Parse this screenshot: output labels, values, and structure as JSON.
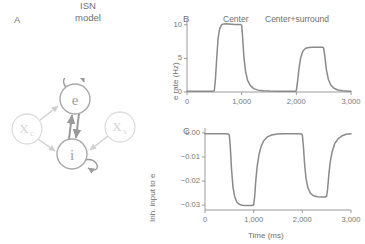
{
  "figure": {
    "panels": [
      {
        "id": "A",
        "letter": "A"
      },
      {
        "id": "B",
        "letter": "B"
      },
      {
        "id": "C",
        "letter": "C"
      }
    ]
  },
  "panel_a": {
    "letter": "A",
    "title_line1": "ISN",
    "title_line2": "model",
    "nodes": [
      {
        "id": "e",
        "label": "e",
        "role": "excitatory-population",
        "cx": 65,
        "cy": 20,
        "r": 15,
        "color": "#8f8f8f"
      },
      {
        "id": "i",
        "label": "i",
        "role": "inhibitory-population",
        "cx": 62,
        "cy": 76,
        "r": 15,
        "color": "#8f8f8f"
      },
      {
        "id": "xc",
        "label": "X",
        "sub": "c",
        "role": "center-input",
        "cx": 17,
        "cy": 51,
        "r": 15,
        "color": "#d2d2d2"
      },
      {
        "id": "xs",
        "label": "X",
        "sub": "s",
        "role": "surround-input",
        "cx": 110,
        "cy": 49,
        "r": 15,
        "color": "#d2d2d2"
      }
    ],
    "connections": [
      {
        "from": "e",
        "to": "e",
        "type": "recurrent-excitation"
      },
      {
        "from": "e",
        "to": "i",
        "type": "excitation"
      },
      {
        "from": "i",
        "to": "e",
        "type": "inhibition"
      },
      {
        "from": "i",
        "to": "i",
        "type": "recurrent-inhibition"
      },
      {
        "from": "xc",
        "to": "e",
        "type": "input"
      },
      {
        "from": "xc",
        "to": "i",
        "type": "input"
      },
      {
        "from": "xs",
        "to": "i",
        "type": "input"
      }
    ]
  },
  "conditions": {
    "center": "Center",
    "center_surround": "Center+surround"
  },
  "chart_data": [
    {
      "type": "line",
      "panel": "B",
      "title": "",
      "xlabel": "",
      "ylabel": "e rate (Hz)",
      "xlim": [
        0,
        3000
      ],
      "ylim": [
        0,
        11
      ],
      "xticks": [
        0,
        1000,
        2000,
        3000
      ],
      "xticklabels": [
        "0",
        "1,000",
        "2,000",
        "3,000"
      ],
      "yticks": [
        0,
        5,
        10
      ],
      "yticklabels": [
        "0",
        "5",
        "10"
      ],
      "grid": false,
      "legend": "none",
      "annotations": [
        {
          "text": "Center",
          "x": 750
        },
        {
          "text": "Center+surround",
          "x": 2250
        }
      ],
      "line_color": "#8a8a8a",
      "series": [
        {
          "name": "e rate",
          "x": [
            0,
            100,
            200,
            300,
            400,
            480,
            500,
            520,
            545,
            570,
            600,
            640,
            700,
            760,
            820,
            880,
            940,
            985,
            1000,
            1015,
            1040,
            1070,
            1110,
            1160,
            1220,
            1300,
            1400,
            1520,
            1650,
            1800,
            1950,
            1985,
            2000,
            2020,
            2050,
            2080,
            2120,
            2170,
            2230,
            2300,
            2380,
            2450,
            2485,
            2500,
            2520,
            2550,
            2585,
            2630,
            2690,
            2760,
            2850,
            2950,
            3000
          ],
          "y": [
            0.12,
            0.12,
            0.12,
            0.12,
            0.12,
            0.13,
            0.2,
            1.9,
            5.2,
            8.1,
            9.5,
            10.05,
            10.15,
            10.12,
            10.08,
            10.05,
            10.03,
            10.02,
            9.9,
            8.4,
            5.3,
            3.1,
            1.7,
            0.95,
            0.5,
            0.28,
            0.18,
            0.14,
            0.12,
            0.12,
            0.12,
            0.13,
            0.2,
            1.4,
            3.6,
            5.1,
            6.1,
            6.5,
            6.62,
            6.65,
            6.66,
            6.66,
            6.65,
            6.5,
            5.4,
            3.3,
            1.9,
            1.05,
            0.55,
            0.3,
            0.18,
            0.13,
            0.12
          ]
        }
      ]
    },
    {
      "type": "line",
      "panel": "C",
      "title": "",
      "xlabel": "Time (ms)",
      "ylabel": "Inh. input to e",
      "xlim": [
        0,
        3000
      ],
      "ylim": [
        -0.032,
        0.002
      ],
      "xticks": [
        0,
        1000,
        2000,
        3000
      ],
      "xticklabels": [
        "0",
        "1,000",
        "2,000",
        "3,000"
      ],
      "yticks": [
        0.0,
        -0.01,
        -0.02,
        -0.03
      ],
      "yticklabels": [
        "0.00",
        "−0.01",
        "−0.02",
        "−0.03"
      ],
      "grid": false,
      "legend": "none",
      "line_color": "#8a8a8a",
      "series": [
        {
          "name": "inhibitory input to e",
          "x": [
            0,
            150,
            300,
            420,
            480,
            500,
            520,
            545,
            575,
            610,
            655,
            710,
            770,
            840,
            910,
            970,
            1000,
            1020,
            1045,
            1075,
            1110,
            1155,
            1210,
            1280,
            1370,
            1480,
            1620,
            1780,
            1950,
            1985,
            2000,
            2020,
            2045,
            2075,
            2115,
            2165,
            2230,
            2310,
            2400,
            2470,
            2500,
            2520,
            2545,
            2575,
            2615,
            2665,
            2730,
            2810,
            2900,
            3000
          ],
          "y": [
            -0.0004,
            -0.0004,
            -0.0004,
            -0.0004,
            -0.0005,
            -0.001,
            -0.006,
            -0.015,
            -0.0225,
            -0.0265,
            -0.0288,
            -0.0297,
            -0.03,
            -0.0301,
            -0.0301,
            -0.0301,
            -0.0299,
            -0.0265,
            -0.0195,
            -0.0135,
            -0.009,
            -0.0055,
            -0.0032,
            -0.0017,
            -0.0009,
            -0.0005,
            -0.0004,
            -0.0004,
            -0.0004,
            -0.0005,
            -0.0009,
            -0.005,
            -0.0125,
            -0.0188,
            -0.0228,
            -0.025,
            -0.0261,
            -0.0265,
            -0.0266,
            -0.0266,
            -0.0263,
            -0.0232,
            -0.0172,
            -0.0118,
            -0.0076,
            -0.0045,
            -0.0026,
            -0.0013,
            -0.0006,
            -0.0004
          ]
        }
      ]
    }
  ]
}
